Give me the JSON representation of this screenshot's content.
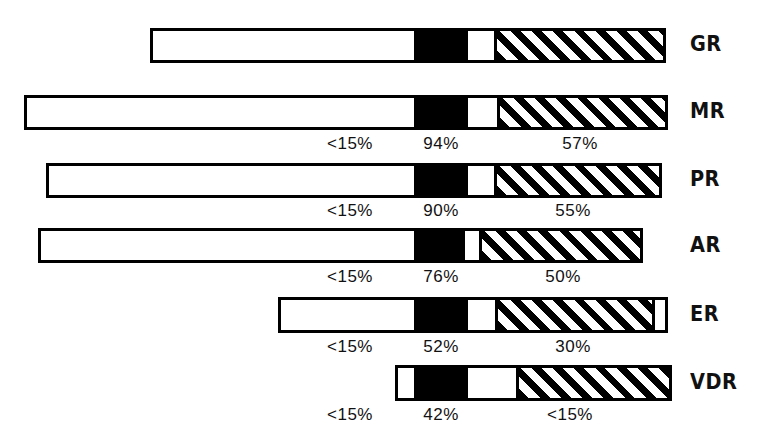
{
  "figure": {
    "width": 760,
    "height": 446,
    "background": "#ffffff",
    "ink_color": "#000000"
  },
  "chart_data": {
    "type": "bar",
    "title": "",
    "subtitle": "",
    "xlabel": "",
    "ylabel": "",
    "orientation": "horizontal",
    "grid": false,
    "legend_position": "none",
    "categories": [
      "GR",
      "MR",
      "PR",
      "AR",
      "ER",
      "VDR"
    ],
    "segment_styles": [
      "white",
      "black",
      "white-gap",
      "hatch"
    ],
    "series": [
      {
        "name": "white",
        "label": "open segment"
      },
      {
        "name": "black",
        "label": "solid segment"
      },
      {
        "name": "hatch",
        "label": "hatched segment"
      }
    ],
    "annotations": [
      {
        "category": "MR",
        "white": "<15%",
        "black": "94%",
        "hatch": "57%"
      },
      {
        "category": "PR",
        "white": "<15%",
        "black": "90%",
        "hatch": "55%"
      },
      {
        "category": "AR",
        "white": "<15%",
        "black": "76%",
        "hatch": "50%"
      },
      {
        "category": "ER",
        "white": "<15%",
        "black": "52%",
        "hatch": "30%"
      },
      {
        "category": "VDR",
        "white": "<15%",
        "black": "42%",
        "hatch": "<15%"
      }
    ],
    "bars": [
      {
        "category": "GR",
        "label": "GR",
        "x_left": 150,
        "x_right": 666,
        "y_top": 28,
        "height": 35,
        "black_start": 414,
        "black_end": 468,
        "hatch_start": 494,
        "hatch_end": 666,
        "values": {
          "white": "",
          "black": "",
          "hatch": ""
        }
      },
      {
        "category": "MR",
        "label": "MR",
        "x_left": 24,
        "x_right": 668,
        "y_top": 95,
        "height": 35,
        "black_start": 414,
        "black_end": 468,
        "hatch_start": 497,
        "hatch_end": 668,
        "values": {
          "white": "<15%",
          "black": "94%",
          "hatch": "57%"
        }
      },
      {
        "category": "PR",
        "label": "PR",
        "x_left": 46,
        "x_right": 662,
        "y_top": 163,
        "height": 35,
        "black_start": 414,
        "black_end": 468,
        "hatch_start": 494,
        "hatch_end": 662,
        "values": {
          "white": "<15%",
          "black": "90%",
          "hatch": "55%"
        }
      },
      {
        "category": "AR",
        "label": "AR",
        "x_left": 38,
        "x_right": 643,
        "y_top": 228,
        "height": 35,
        "black_start": 414,
        "black_end": 465,
        "hatch_start": 479,
        "hatch_end": 643,
        "values": {
          "white": "<15%",
          "black": "76%",
          "hatch": "50%"
        }
      },
      {
        "category": "ER",
        "label": "ER",
        "x_left": 278,
        "x_right": 668,
        "y_top": 297,
        "height": 36,
        "black_start": 414,
        "black_end": 468,
        "hatch_start": 495,
        "hatch_end": 655,
        "values": {
          "white": "<15%",
          "black": "52%",
          "hatch": "30%"
        }
      },
      {
        "category": "VDR",
        "label": "VDR",
        "x_left": 395,
        "x_right": 672,
        "y_top": 365,
        "height": 36,
        "black_start": 414,
        "black_end": 468,
        "hatch_start": 516,
        "hatch_end": 672,
        "values": {
          "white": "<15%",
          "black": "42%",
          "hatch": "<15%"
        }
      }
    ]
  },
  "labels": {
    "series": [
      {
        "id": "gr",
        "text": "GR",
        "x": 690,
        "y": 34
      },
      {
        "id": "mr",
        "text": "MR",
        "x": 690,
        "y": 101
      },
      {
        "id": "pr",
        "text": "PR",
        "x": 690,
        "y": 169
      },
      {
        "id": "ar",
        "text": "AR",
        "x": 690,
        "y": 235
      },
      {
        "id": "er",
        "text": "ER",
        "x": 690,
        "y": 304
      },
      {
        "id": "vdr",
        "text": "VDR",
        "x": 690,
        "y": 372
      }
    ],
    "percent_annotations": [
      {
        "id": "mr-white",
        "text": "<15%",
        "x": 315,
        "y": 135,
        "w": 70
      },
      {
        "id": "mr-black",
        "text": "94%",
        "x": 412,
        "y": 135,
        "w": 58
      },
      {
        "id": "mr-hatch",
        "text": "57%",
        "x": 551,
        "y": 135,
        "w": 58
      },
      {
        "id": "pr-white",
        "text": "<15%",
        "x": 315,
        "y": 202,
        "w": 70
      },
      {
        "id": "pr-black",
        "text": "90%",
        "x": 412,
        "y": 202,
        "w": 58
      },
      {
        "id": "pr-hatch",
        "text": "55%",
        "x": 544,
        "y": 202,
        "w": 58
      },
      {
        "id": "ar-white",
        "text": "<15%",
        "x": 315,
        "y": 268,
        "w": 70
      },
      {
        "id": "ar-black",
        "text": "76%",
        "x": 412,
        "y": 268,
        "w": 58
      },
      {
        "id": "ar-hatch",
        "text": "50%",
        "x": 534,
        "y": 268,
        "w": 58
      },
      {
        "id": "er-white",
        "text": "<15%",
        "x": 315,
        "y": 338,
        "w": 70
      },
      {
        "id": "er-black",
        "text": "52%",
        "x": 412,
        "y": 338,
        "w": 58
      },
      {
        "id": "er-hatch",
        "text": "30%",
        "x": 544,
        "y": 338,
        "w": 58
      },
      {
        "id": "vdr-white",
        "text": "<15%",
        "x": 315,
        "y": 406,
        "w": 70
      },
      {
        "id": "vdr-black",
        "text": "42%",
        "x": 412,
        "y": 406,
        "w": 58
      },
      {
        "id": "vdr-hatch",
        "text": "<15%",
        "x": 535,
        "y": 406,
        "w": 70
      }
    ]
  }
}
